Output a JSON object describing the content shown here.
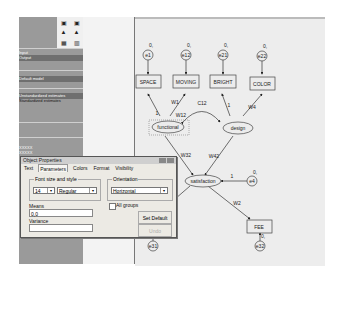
{
  "left_panel": {
    "rows": [
      {
        "text": "Input",
        "top": 33
      },
      {
        "text": "Output",
        "top": 38
      },
      {
        "text": "Default model",
        "top": 59
      },
      {
        "text": "Unstandardized estimates",
        "top": 76
      },
      {
        "text": "Standardized estimates",
        "top": 81
      },
      {
        "text": "XXXXX",
        "top": 128
      },
      {
        "text": "XXXXX",
        "top": 133
      }
    ]
  },
  "dialog": {
    "title": "Object Properties",
    "tabs": [
      "Text",
      "Parameters",
      "Colors",
      "Format",
      "Visibility"
    ],
    "active_tab": "Parameters",
    "font_group_label": "Font size and style",
    "font_size": "14",
    "font_style": "Regular",
    "orientation_label": "Orientation",
    "orientation": "Horizontal",
    "all_groups_label": "All groups",
    "means_label": "Means",
    "means_value": "0,0",
    "variance_label": "Variance",
    "variance_value": "",
    "set_default_label": "Set Default",
    "undo_label": "Undo"
  },
  "diagram": {
    "observed": [
      {
        "name": "SPACE",
        "x": 32,
        "y": 61
      },
      {
        "name": "MOVING",
        "x": 71,
        "y": 61
      },
      {
        "name": "BRIGHT",
        "x": 108,
        "y": 61
      },
      {
        "name": "COLOR",
        "x": 148,
        "y": 61
      },
      {
        "name": "UENCY",
        "x": 30,
        "y": 218
      },
      {
        "name": "FEE",
        "x": 147,
        "y": 218
      }
    ],
    "errors": [
      {
        "name": "e1",
        "x": 46,
        "y": 36,
        "mean": "0,"
      },
      {
        "name": "e12",
        "x": 84,
        "y": 36,
        "mean": "0,"
      },
      {
        "name": "e21",
        "x": 121,
        "y": 36,
        "mean": "0,"
      },
      {
        "name": "e22",
        "x": 160,
        "y": 36,
        "mean": "0,"
      },
      {
        "name": "e4",
        "x": 118,
        "y": 145,
        "mean": "0,"
      },
      {
        "name": "e31",
        "x": 37,
        "y": 239,
        "mean": "0,"
      },
      {
        "name": "e32",
        "x": 145,
        "y": 239,
        "mean": "0,"
      }
    ],
    "latent": [
      {
        "name": "functional",
        "x": 62,
        "y": 110
      },
      {
        "name": "design",
        "x": 102,
        "y": 110
      },
      {
        "name": "satisfaction",
        "x": 82,
        "y": 162
      }
    ],
    "path_labels": [
      {
        "text": "1",
        "x": 35,
        "y": 99
      },
      {
        "text": "W1",
        "x": 57,
        "y": 88
      },
      {
        "text": "C12",
        "x": 84,
        "y": 89
      },
      {
        "text": "1",
        "x": 98,
        "y": 93
      },
      {
        "text": "W4",
        "x": 117,
        "y": 92
      },
      {
        "text": "W12",
        "x": 60,
        "y": 95
      },
      {
        "text": "W32",
        "x": 56,
        "y": 139
      },
      {
        "text": "W42",
        "x": 87,
        "y": 139
      },
      {
        "text": "1",
        "x": 49,
        "y": 177
      },
      {
        "text": "W2",
        "x": 117,
        "y": 189
      },
      {
        "text": "1",
        "x": 104,
        "y": 158
      }
    ]
  }
}
